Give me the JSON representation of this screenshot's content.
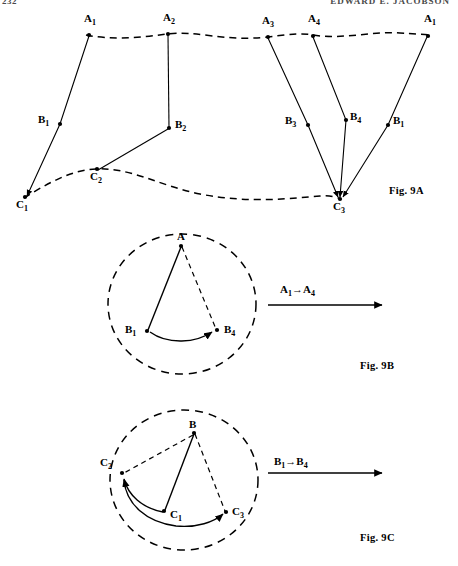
{
  "page": {
    "running_head_folio": "232",
    "running_head_title": "EDWARD E. JACOBSON"
  },
  "figures": [
    {
      "id": "fig-9a",
      "caption": "Fig. 9A",
      "description": "Three-level trajectory diagram: upper dashed locus through A points, lower dashed locus through C points, straight segments linking A to B to C.",
      "point_labels": [
        {
          "name": "A1-left",
          "text": "A",
          "sub": "1"
        },
        {
          "name": "A2",
          "text": "A",
          "sub": "2"
        },
        {
          "name": "A3",
          "text": "A",
          "sub": "3"
        },
        {
          "name": "A4",
          "text": "A",
          "sub": "4"
        },
        {
          "name": "A1-right",
          "text": "A",
          "sub": "1"
        },
        {
          "name": "B1-left",
          "text": "B",
          "sub": "1"
        },
        {
          "name": "B2",
          "text": "B",
          "sub": "2"
        },
        {
          "name": "B3",
          "text": "B",
          "sub": "3"
        },
        {
          "name": "B4",
          "text": "B",
          "sub": "4"
        },
        {
          "name": "B1-right",
          "text": "B",
          "sub": "1"
        },
        {
          "name": "C1",
          "text": "C",
          "sub": "1"
        },
        {
          "name": "C2",
          "text": "C",
          "sub": "2"
        },
        {
          "name": "C3",
          "text": "C",
          "sub": "3"
        }
      ]
    },
    {
      "id": "fig-9b",
      "caption": "Fig. 9B",
      "transition_label": {
        "from_text": "A",
        "from_sub": "1",
        "arrow": "→",
        "to_text": "A",
        "to_sub": "4"
      },
      "point_labels": [
        {
          "name": "A",
          "text": "A",
          "sub": ""
        },
        {
          "name": "B1",
          "text": "B",
          "sub": "1"
        },
        {
          "name": "B4",
          "text": "B",
          "sub": "4"
        }
      ]
    },
    {
      "id": "fig-9c",
      "caption": "Fig. 9C",
      "transition_label": {
        "from_text": "B",
        "from_sub": "1",
        "arrow": "→",
        "to_text": "B",
        "to_sub": "4"
      },
      "point_labels": [
        {
          "name": "B",
          "text": "B",
          "sub": ""
        },
        {
          "name": "C2",
          "text": "C",
          "sub": "2"
        },
        {
          "name": "C1",
          "text": "C",
          "sub": "1"
        },
        {
          "name": "C3",
          "text": "C",
          "sub": "3"
        }
      ]
    }
  ],
  "colors": {
    "ink": "#000000",
    "head": "#4a4a4a",
    "paper": "#ffffff"
  }
}
